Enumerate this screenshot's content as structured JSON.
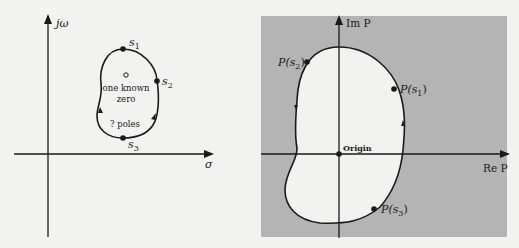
{
  "left_panel": {
    "axes": {
      "vertical_label": "jω",
      "horizontal_label": "σ"
    },
    "points": [
      {
        "name": "s1",
        "label": "s",
        "subscript": "1"
      },
      {
        "name": "s2",
        "label": "s",
        "subscript": "2"
      },
      {
        "name": "s3",
        "label": "s",
        "subscript": "3"
      }
    ],
    "zero_marker": "o",
    "zero_text_line1": "one known",
    "zero_text_line2": "zero",
    "poles_text": "? poles"
  },
  "right_panel": {
    "axes": {
      "vertical_label": "Im P",
      "horizontal_label": "Re P"
    },
    "origin_label": "Origin",
    "points": [
      {
        "name": "P(s1)",
        "prefix": "P(s",
        "subscript": "1",
        "suffix": ")"
      },
      {
        "name": "P(s2)",
        "prefix": "P(s",
        "subscript": "2",
        "suffix": ")"
      },
      {
        "name": "P(s3)",
        "prefix": "P(s",
        "subscript": "3",
        "suffix": ")"
      }
    ]
  },
  "colors": {
    "background": "#f2f2f0",
    "shaded_region": "#b4b4b4",
    "ink": "#1a1a1a"
  }
}
